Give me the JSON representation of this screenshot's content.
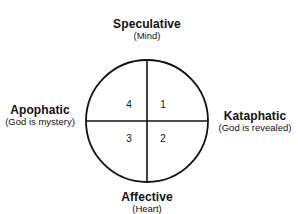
{
  "diagram": {
    "type": "quadrant-circle",
    "axes": {
      "top": {
        "title": "Speculative",
        "subtitle": "(Mind)"
      },
      "bottom": {
        "title": "Affective",
        "subtitle": "(Heart)"
      },
      "left": {
        "title": "Apophatic",
        "subtitle": "(God is mystery)"
      },
      "right": {
        "title": "Kataphatic",
        "subtitle": "(God is revealed)"
      }
    },
    "quadrants": [
      {
        "position": "top-right",
        "number": "1"
      },
      {
        "position": "bottom-right",
        "number": "2"
      },
      {
        "position": "bottom-left",
        "number": "3"
      },
      {
        "position": "top-left",
        "number": "4"
      }
    ],
    "colors": {
      "stroke": "#111111",
      "text": "#111111",
      "background": "#ffffff"
    }
  }
}
